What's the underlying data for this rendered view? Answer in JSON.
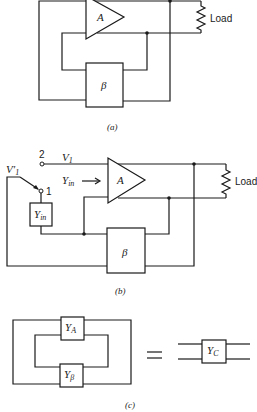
{
  "figure": {
    "part_a": {
      "caption": "(a)",
      "amplifier_label": "A",
      "feedback_label": "β",
      "load_label": "Load"
    },
    "part_b": {
      "caption": "(b)",
      "amplifier_label": "A",
      "feedback_label": "β",
      "load_label": "Load",
      "terminal_2_label": "2",
      "terminal_1_label": "1",
      "voltage_label": "V",
      "voltage_sub": "1",
      "voltage_prime_label": "V′",
      "voltage_prime_sub": "1",
      "admittance_arrow_label": "Y",
      "admittance_arrow_sub": "in",
      "admittance_box_label": "Y",
      "admittance_box_sub": "in"
    },
    "part_c": {
      "caption": "(c)",
      "ya_label": "Y",
      "ya_sub": "A",
      "yb_label": "Y",
      "yb_sub": "β",
      "equals": "=",
      "yc_label": "Y",
      "yc_sub": "C"
    }
  }
}
